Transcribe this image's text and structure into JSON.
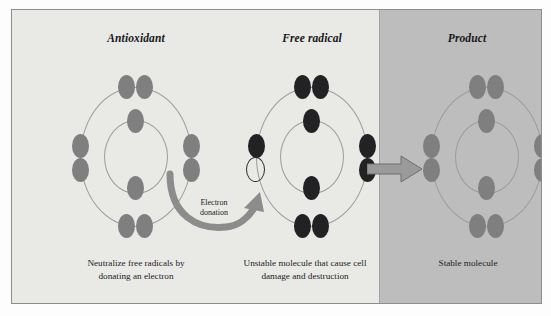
{
  "figure": {
    "type": "diagram",
    "colors": {
      "panel_light_bg": "#e9e9e6",
      "panel_dark_bg": "#bdbdbd",
      "frame_border": "#8d8d8d",
      "orbit_stroke": "#9c9c9c",
      "electron_light": "#7f7f80",
      "electron_dark": "#222224",
      "arrow_fill": "#8c8c8c",
      "text": "#1c1c1f"
    }
  },
  "panels": [
    {
      "id": "antioxidant",
      "title": "Antioxidant",
      "caption_line1": "Neutralize free radicals by",
      "caption_line2": "donating an electron",
      "electron_style": "light",
      "outer_electrons": 8,
      "inner_electrons": 2,
      "has_vacancy": false
    },
    {
      "id": "free-radical",
      "title": "Free radical",
      "caption_line1": "Unstable molecule that cause cell",
      "caption_line2": "damage and destruction",
      "electron_style": "dark",
      "outer_electrons": 7,
      "inner_electrons": 2,
      "has_vacancy": true,
      "vacancy_position": "left-lower"
    },
    {
      "id": "product",
      "title": "Product",
      "caption_line1": "Stable molecule",
      "caption_line2": "",
      "electron_style": "light",
      "outer_electrons": 8,
      "inner_electrons": 2,
      "has_vacancy": false
    }
  ],
  "annotations": {
    "donation_label_line1": "Electron",
    "donation_label_line2": "donation",
    "donation_arrow_name": "curved-donation-arrow",
    "transition_arrow_name": "block-transition-arrow"
  }
}
